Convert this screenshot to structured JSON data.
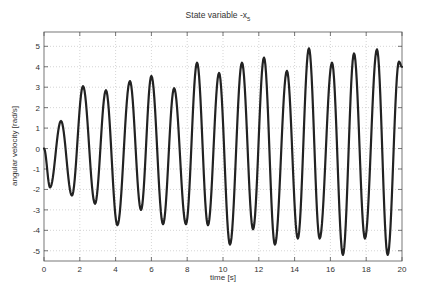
{
  "chart_data": {
    "type": "line",
    "title": "State variable -x",
    "title_subscript": "5",
    "xlabel": "time [s]",
    "ylabel": "angular velocity [rad/s]",
    "xlim": [
      0,
      20
    ],
    "ylim": [
      -5.5,
      5.7
    ],
    "xticks": [
      0,
      2,
      4,
      6,
      8,
      10,
      12,
      14,
      16,
      18,
      20
    ],
    "yticks": [
      5,
      4,
      3,
      2,
      1,
      0,
      -1,
      -2,
      -3,
      -4,
      -5
    ],
    "grid": true,
    "legend": null,
    "series": [
      {
        "name": "-x5",
        "color": "#222222",
        "description": "oscillating angular velocity with growing amplitude; extrema listed",
        "x": [
          0,
          0.34,
          0.95,
          1.56,
          2.18,
          2.85,
          3.46,
          4.1,
          4.8,
          5.42,
          6.0,
          6.65,
          7.27,
          7.93,
          8.55,
          9.16,
          9.78,
          10.39,
          11.06,
          11.68,
          12.29,
          12.9,
          13.57,
          14.18,
          14.8,
          15.4,
          16.09,
          16.7,
          17.32,
          17.93,
          18.6,
          19.2,
          19.83,
          20
        ],
        "y": [
          0,
          -1.9,
          1.35,
          -2.3,
          3.05,
          -2.7,
          2.85,
          -3.75,
          3.3,
          -3.0,
          3.55,
          -3.7,
          2.95,
          -3.7,
          4.2,
          -3.75,
          3.7,
          -4.7,
          4.2,
          -3.95,
          4.45,
          -4.7,
          3.8,
          -4.4,
          4.9,
          -4.4,
          4.2,
          -5.2,
          4.65,
          -4.4,
          4.85,
          -5.2,
          4.25,
          4.0
        ]
      }
    ]
  }
}
